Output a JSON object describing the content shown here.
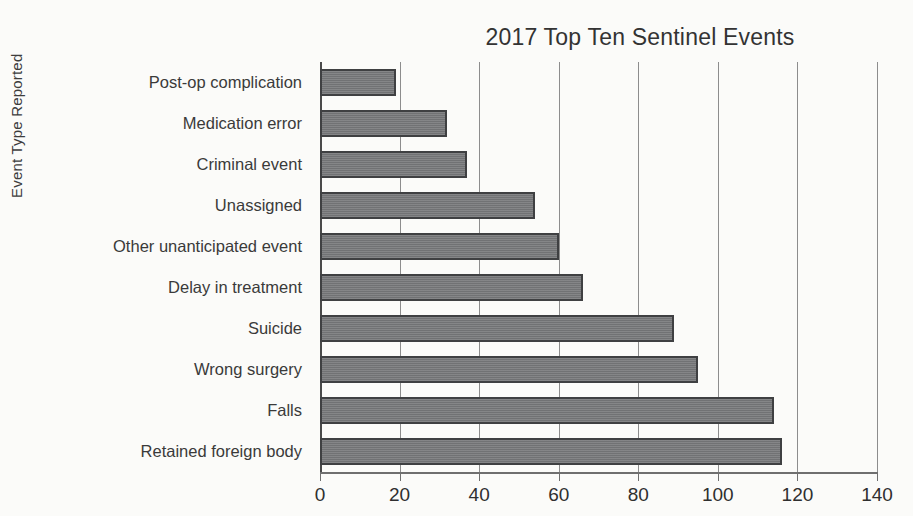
{
  "chart_data": {
    "type": "bar",
    "orientation": "horizontal",
    "title": "2017 Top Ten Sentinel Events",
    "xlabel": "",
    "ylabel": "Event Type Reported",
    "categories": [
      "Post-op complication",
      "Medication error",
      "Criminal event",
      "Unassigned",
      "Other unanticipated event",
      "Delay in treatment",
      "Suicide",
      "Wrong surgery",
      "Falls",
      "Retained foreign body"
    ],
    "values": [
      19,
      32,
      37,
      54,
      60,
      66,
      89,
      95,
      114,
      116
    ],
    "xlim": [
      0,
      140
    ],
    "xticks": [
      0,
      20,
      40,
      60,
      80,
      100,
      120,
      140
    ],
    "xtick_labels": [
      "0",
      "20",
      "40",
      "60",
      "80",
      "100",
      "120",
      "140"
    ],
    "grid": "vertical-only",
    "legend": "none",
    "bar_color": "#77787a",
    "bar_border_color": "#3f4042",
    "gridline_color": "#8d8d8d",
    "axis_color": "#4a4a4a",
    "background_color": "#fbfbf9"
  }
}
